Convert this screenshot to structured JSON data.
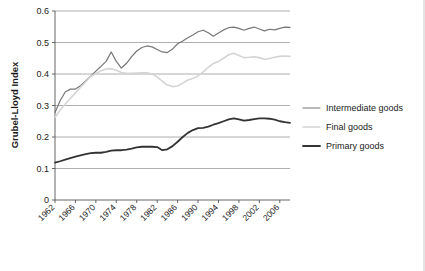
{
  "chart_data": {
    "type": "line",
    "title": "",
    "xlabel": "",
    "ylabel": "Grubel-Lloyd Index",
    "ylim": [
      0,
      0.6
    ],
    "yticks": [
      "0",
      "0.1",
      "0.2",
      "0.3",
      "0.4",
      "0.5",
      "0.6"
    ],
    "ytick_values": [
      0,
      0.1,
      0.2,
      0.3,
      0.4,
      0.5,
      0.6
    ],
    "grid": true,
    "legend_position": "right",
    "x": [
      1962,
      1963,
      1964,
      1965,
      1966,
      1967,
      1968,
      1969,
      1970,
      1971,
      1972,
      1973,
      1974,
      1975,
      1976,
      1977,
      1978,
      1979,
      1980,
      1981,
      1982,
      1983,
      1984,
      1985,
      1986,
      1987,
      1988,
      1989,
      1990,
      1991,
      1992,
      1993,
      1994,
      1995,
      1996,
      1997,
      1998,
      1999,
      2000,
      2001,
      2002,
      2003,
      2004,
      2005,
      2006,
      2007,
      2008
    ],
    "xtick_labels": [
      "1962",
      "1966",
      "1970",
      "1974",
      "1978",
      "1982",
      "1986",
      "1990",
      "1994",
      "1998",
      "2002",
      "2006"
    ],
    "xtick_values": [
      1962,
      1966,
      1970,
      1974,
      1978,
      1982,
      1986,
      1990,
      1994,
      1998,
      2002,
      2006
    ],
    "series": [
      {
        "name": "Intermediate goods",
        "color": "#777777",
        "width": 1.2,
        "values": [
          0.278,
          0.315,
          0.343,
          0.352,
          0.352,
          0.363,
          0.378,
          0.393,
          0.409,
          0.424,
          0.44,
          0.47,
          0.44,
          0.419,
          0.434,
          0.455,
          0.473,
          0.484,
          0.489,
          0.486,
          0.478,
          0.47,
          0.468,
          0.479,
          0.496,
          0.505,
          0.515,
          0.524,
          0.534,
          0.539,
          0.531,
          0.52,
          0.53,
          0.54,
          0.547,
          0.549,
          0.545,
          0.539,
          0.545,
          0.549,
          0.543,
          0.537,
          0.542,
          0.54,
          0.545,
          0.549,
          0.548
        ]
      },
      {
        "name": "Final goods",
        "color": "#d4d4d4",
        "width": 1.6,
        "values": [
          0.263,
          0.285,
          0.305,
          0.322,
          0.34,
          0.358,
          0.375,
          0.392,
          0.402,
          0.41,
          0.416,
          0.417,
          0.412,
          0.405,
          0.402,
          0.402,
          0.403,
          0.404,
          0.404,
          0.4,
          0.391,
          0.377,
          0.365,
          0.36,
          0.362,
          0.371,
          0.381,
          0.386,
          0.394,
          0.407,
          0.421,
          0.433,
          0.44,
          0.45,
          0.461,
          0.466,
          0.459,
          0.452,
          0.453,
          0.455,
          0.452,
          0.447,
          0.449,
          0.453,
          0.456,
          0.457,
          0.456
        ]
      },
      {
        "name": "Primary goods",
        "color": "#333333",
        "width": 1.8,
        "values": [
          0.119,
          0.123,
          0.128,
          0.133,
          0.138,
          0.142,
          0.146,
          0.149,
          0.15,
          0.15,
          0.153,
          0.157,
          0.158,
          0.158,
          0.16,
          0.163,
          0.167,
          0.169,
          0.169,
          0.169,
          0.168,
          0.158,
          0.161,
          0.171,
          0.185,
          0.2,
          0.213,
          0.222,
          0.228,
          0.229,
          0.233,
          0.239,
          0.244,
          0.25,
          0.256,
          0.259,
          0.256,
          0.252,
          0.254,
          0.257,
          0.259,
          0.259,
          0.258,
          0.255,
          0.25,
          0.247,
          0.245
        ]
      }
    ]
  },
  "legend": {
    "items": [
      {
        "label": "Intermediate goods"
      },
      {
        "label": "Final goods"
      },
      {
        "label": "Primary goods"
      }
    ]
  }
}
